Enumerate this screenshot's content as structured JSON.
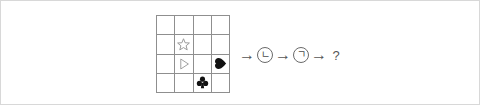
{
  "page": {
    "background_color": "#ffffff",
    "border_color": "#d8d8d8"
  },
  "puzzle": {
    "grid": {
      "rows": 4,
      "cols": 4,
      "line_color": "#8f8f8f",
      "cells": [
        {
          "row": 0,
          "col": 0,
          "shape": "empty",
          "label": ""
        },
        {
          "row": 0,
          "col": 1,
          "shape": "empty",
          "label": ""
        },
        {
          "row": 0,
          "col": 2,
          "shape": "empty",
          "label": ""
        },
        {
          "row": 0,
          "col": 3,
          "shape": "empty",
          "label": ""
        },
        {
          "row": 1,
          "col": 0,
          "shape": "empty",
          "label": ""
        },
        {
          "row": 1,
          "col": 1,
          "shape": "star-outline",
          "label": "star"
        },
        {
          "row": 1,
          "col": 2,
          "shape": "empty",
          "label": ""
        },
        {
          "row": 1,
          "col": 3,
          "shape": "empty",
          "label": ""
        },
        {
          "row": 2,
          "col": 0,
          "shape": "empty",
          "label": ""
        },
        {
          "row": 2,
          "col": 1,
          "shape": "triangle-outline",
          "label": "triangle-right"
        },
        {
          "row": 2,
          "col": 2,
          "shape": "empty",
          "label": ""
        },
        {
          "row": 2,
          "col": 3,
          "shape": "heart-filled",
          "label": "heart"
        },
        {
          "row": 3,
          "col": 0,
          "shape": "empty",
          "label": ""
        },
        {
          "row": 3,
          "col": 1,
          "shape": "empty",
          "label": ""
        },
        {
          "row": 3,
          "col": 2,
          "shape": "club-filled",
          "label": "club"
        },
        {
          "row": 3,
          "col": 3,
          "shape": "empty",
          "label": ""
        }
      ]
    },
    "sequence": {
      "items": [
        {
          "kind": "arrow",
          "text": "→"
        },
        {
          "kind": "token",
          "text": "ㄴ"
        },
        {
          "kind": "arrow",
          "text": "→"
        },
        {
          "kind": "token",
          "text": "ㄱ"
        },
        {
          "kind": "arrow",
          "text": "→"
        },
        {
          "kind": "unknown",
          "text": "?"
        }
      ]
    }
  },
  "colors": {
    "shape_fill": "#111111",
    "shape_outline": "#9a9a9a",
    "grid_line": "#8f8f8f",
    "text": "#555555"
  }
}
